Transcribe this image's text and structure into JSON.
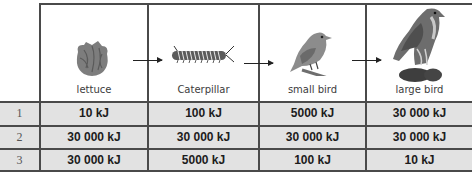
{
  "table": {
    "columns": [
      {
        "label": "lettuce",
        "icon": "lettuce-icon"
      },
      {
        "label": "Caterpillar",
        "icon": "caterpillar-icon"
      },
      {
        "label": "small bird",
        "icon": "small-bird-icon"
      },
      {
        "label": "large bird",
        "icon": "large-bird-icon"
      }
    ],
    "rows": [
      {
        "num": "1",
        "values": [
          "10 kJ",
          "100 kJ",
          "5000 kJ",
          "30 000 kJ"
        ]
      },
      {
        "num": "2",
        "values": [
          "30 000 kJ",
          "30 000 kJ",
          "30 000 kJ",
          "30 000 kJ"
        ]
      },
      {
        "num": "3",
        "values": [
          "30 000 kJ",
          "5000 kJ",
          "100 kJ",
          "10 kJ"
        ]
      }
    ]
  },
  "colors": {
    "row_shade": "#e2e2e2",
    "grid_line": "#4a4a4a",
    "text": "#1c1c1c"
  }
}
